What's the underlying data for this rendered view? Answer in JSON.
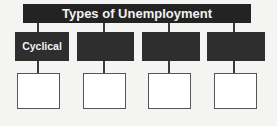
{
  "diagram": {
    "title": "Types of Unemployment",
    "categories": [
      {
        "label": "Cyclical"
      },
      {
        "label": ""
      },
      {
        "label": ""
      },
      {
        "label": ""
      }
    ],
    "answer_boxes": [
      {
        "text": ""
      },
      {
        "text": ""
      },
      {
        "text": ""
      },
      {
        "text": ""
      }
    ],
    "colors": {
      "header": "#232323",
      "category": "#2e2e2e",
      "background": "#f4f4f2"
    }
  }
}
